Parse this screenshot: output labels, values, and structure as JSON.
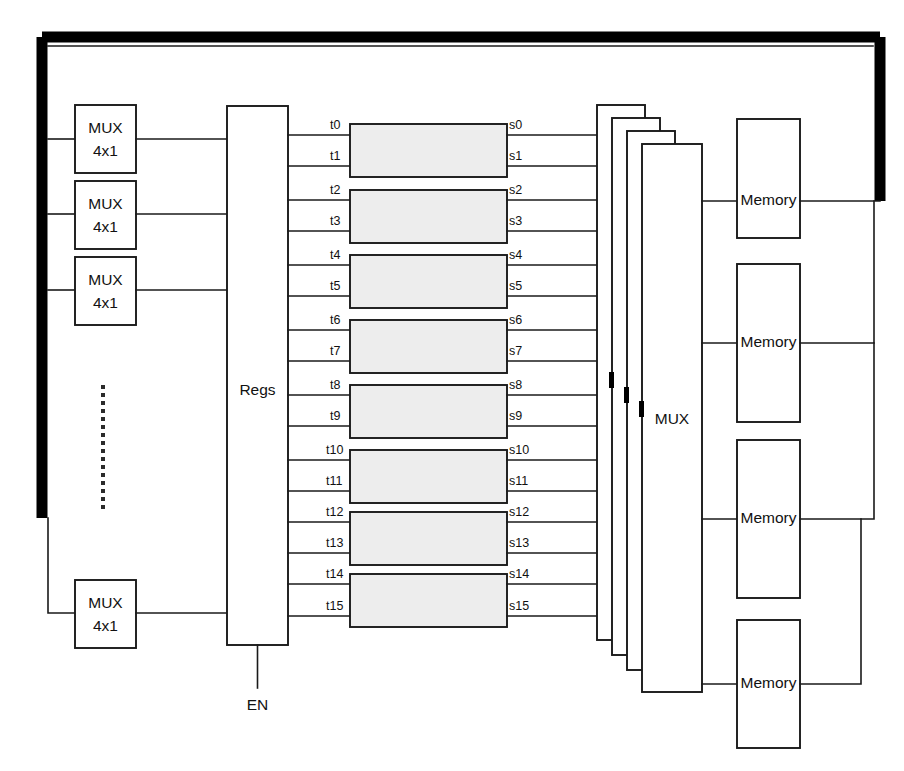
{
  "diagram": {
    "canvas": {
      "width": 904,
      "height": 771
    },
    "colors": {
      "background": "#ffffff",
      "line": "#1a1a1a",
      "bus": "#000000",
      "box_fill": "#ffffff",
      "gray_box_fill": "#ededed",
      "text": "#111111"
    }
  },
  "input_muxes": [
    {
      "label_top": "MUX",
      "label_bottom": "4x1"
    },
    {
      "label_top": "MUX",
      "label_bottom": "4x1"
    },
    {
      "label_top": "MUX",
      "label_bottom": "4x1"
    },
    {
      "label_top": "MUX",
      "label_bottom": "4x1"
    }
  ],
  "ellipsis": {
    "symbol": "vertical-dots",
    "count": 16
  },
  "regs": {
    "label": "Regs",
    "enable_label": "EN"
  },
  "t_signals": [
    "t0",
    "t1",
    "t2",
    "t3",
    "t4",
    "t5",
    "t6",
    "t7",
    "t8",
    "t9",
    "t10",
    "t11",
    "t12",
    "t13",
    "t14",
    "t15"
  ],
  "s_signals": [
    "s0",
    "s1",
    "s2",
    "s3",
    "s4",
    "s5",
    "s6",
    "s7",
    "s8",
    "s9",
    "s10",
    "s11",
    "s12",
    "s13",
    "s14",
    "s15"
  ],
  "processing_units": [
    {
      "name": "unit-0",
      "inputs": [
        "t0",
        "t1"
      ],
      "outputs": [
        "s0",
        "s1"
      ]
    },
    {
      "name": "unit-1",
      "inputs": [
        "t2",
        "t3"
      ],
      "outputs": [
        "s2",
        "s3"
      ]
    },
    {
      "name": "unit-2",
      "inputs": [
        "t4",
        "t5"
      ],
      "outputs": [
        "s4",
        "s5"
      ]
    },
    {
      "name": "unit-3",
      "inputs": [
        "t6",
        "t7"
      ],
      "outputs": [
        "s6",
        "s7"
      ]
    },
    {
      "name": "unit-4",
      "inputs": [
        "t8",
        "t9"
      ],
      "outputs": [
        "s8",
        "s9"
      ]
    },
    {
      "name": "unit-5",
      "inputs": [
        "t10",
        "t11"
      ],
      "outputs": [
        "s10",
        "s11"
      ]
    },
    {
      "name": "unit-6",
      "inputs": [
        "t12",
        "t13"
      ],
      "outputs": [
        "s12",
        "s13"
      ]
    },
    {
      "name": "unit-7",
      "inputs": [
        "t14",
        "t15"
      ],
      "outputs": [
        "s14",
        "s15"
      ]
    }
  ],
  "output_mux_stack": {
    "label": "MUX",
    "count": 4
  },
  "memories": [
    {
      "label": "Memory"
    },
    {
      "label": "Memory"
    },
    {
      "label": "Memory"
    },
    {
      "label": "Memory"
    }
  ]
}
